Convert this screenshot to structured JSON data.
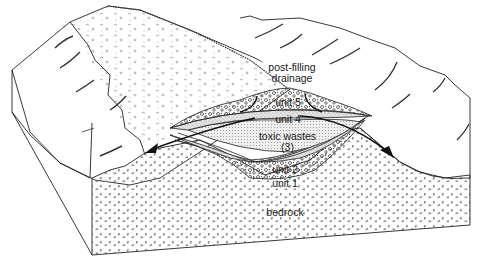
{
  "figure": {
    "type": "geological block diagram"
  },
  "labels": {
    "post_filling_drainage_line1": "post-filling",
    "post_filling_drainage_line2": "drainage",
    "unit5": "unit 5",
    "unit4": "unit 4",
    "toxic_wastes_line1": "toxic wastes",
    "toxic_wastes_line2": "(3)",
    "unit2": "unit 2",
    "unit1": "unit 1",
    "bedrock": "bedrock"
  },
  "layers": [
    {
      "id": "unit5",
      "name": "unit 5",
      "pattern": "coarse gravel/pebbles",
      "position": "cap"
    },
    {
      "id": "unit4",
      "name": "unit 4",
      "pattern": "fine stipple",
      "position": "upper liner"
    },
    {
      "id": "unit3",
      "name": "toxic wastes (3)",
      "pattern": "dense dot stipple",
      "position": "core"
    },
    {
      "id": "unit2",
      "name": "unit 2",
      "pattern": "fine stipple",
      "position": "lower liner"
    },
    {
      "id": "unit1",
      "name": "unit 1",
      "pattern": "coarse gravel",
      "position": "base"
    },
    {
      "id": "bedrock",
      "name": "bedrock",
      "pattern": "dash stipple",
      "position": "substrate"
    }
  ],
  "arrows": [
    {
      "name": "drainage-arrow-left",
      "direction": "down-left"
    },
    {
      "name": "drainage-arrow-right",
      "direction": "down-right"
    }
  ],
  "colors": {
    "ink": "#1a1a1a",
    "stipple": "#7a7a7a",
    "paper": "#ffffff"
  }
}
